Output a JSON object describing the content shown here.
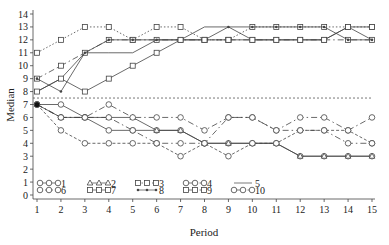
{
  "chart_data": {
    "type": "line",
    "title": "",
    "xlabel": "Period",
    "ylabel": "Median",
    "xlim": [
      1,
      15
    ],
    "ylim": [
      0,
      14
    ],
    "x": [
      1,
      2,
      3,
      4,
      5,
      6,
      7,
      8,
      9,
      10,
      11,
      12,
      13,
      14,
      15
    ],
    "x_ticks": [
      "1",
      "2",
      "3",
      "4",
      "5",
      "6",
      "7",
      "8",
      "9",
      "10",
      "11",
      "12",
      "13",
      "14",
      "15"
    ],
    "y_ticks": [
      "0",
      "1",
      "2",
      "3",
      "4",
      "5",
      "6",
      "7",
      "8",
      "9",
      "10",
      "11",
      "12",
      "13",
      "14"
    ],
    "grid": false,
    "reference_line": {
      "y": 7.5,
      "style": "dashed"
    },
    "legend": {
      "position": "bottom-inside",
      "entries": [
        {
          "label": "1",
          "marker": "circle",
          "line": "solid"
        },
        {
          "label": "2",
          "marker": "triangle",
          "line": "solid"
        },
        {
          "label": "3",
          "marker": "square",
          "line": "dotted"
        },
        {
          "label": "4",
          "marker": "circle",
          "line": "dash-dot"
        },
        {
          "label": "5",
          "marker": "none",
          "line": "solid"
        },
        {
          "label": "6",
          "marker": "circle",
          "line": "dashed"
        },
        {
          "label": "7",
          "marker": "square",
          "line": "solid"
        },
        {
          "label": "8",
          "marker": "dot",
          "line": "solid"
        },
        {
          "label": "9",
          "marker": "square",
          "line": "dash-dot"
        },
        {
          "label": "10",
          "marker": "circle",
          "line": "dash-dot"
        }
      ]
    },
    "series": [
      {
        "name": "3",
        "values": [
          11,
          12,
          13,
          13,
          12,
          13,
          13,
          12,
          12,
          13,
          13,
          13,
          13,
          13,
          13
        ]
      },
      {
        "name": "9",
        "values": [
          9,
          10,
          11,
          12,
          12,
          12,
          12,
          12,
          12,
          12,
          12,
          12,
          12,
          12,
          12
        ]
      },
      {
        "name": "5",
        "values": [
          8,
          9,
          11,
          11,
          11,
          12,
          12,
          13,
          13,
          12,
          12,
          12,
          12,
          13,
          12
        ]
      },
      {
        "name": "8",
        "values": [
          9,
          8,
          11,
          12,
          12,
          12,
          12,
          12,
          13,
          13,
          13,
          13,
          13,
          12,
          12
        ]
      },
      {
        "name": "7",
        "values": [
          8,
          9,
          8,
          9,
          10,
          11,
          12,
          12,
          12,
          12,
          12,
          12,
          12,
          13,
          13
        ]
      },
      {
        "name": "1",
        "values": [
          7,
          7,
          6,
          5,
          5,
          5,
          5,
          4,
          4,
          4,
          4,
          3,
          3,
          3,
          3
        ]
      },
      {
        "name": "2",
        "values": [
          7,
          6,
          6,
          6,
          6,
          5,
          5,
          4,
          4,
          4,
          4,
          3,
          3,
          3,
          3
        ]
      },
      {
        "name": "4",
        "values": [
          7,
          6,
          6,
          6,
          5,
          4,
          4,
          4,
          6,
          6,
          5,
          5,
          5,
          4,
          4
        ]
      },
      {
        "name": "6",
        "values": [
          7,
          5,
          4,
          4,
          4,
          4,
          3,
          4,
          3,
          4,
          4,
          5,
          5,
          5,
          4
        ]
      },
      {
        "name": "10",
        "values": [
          7,
          6,
          6,
          7,
          6,
          6,
          6,
          5,
          6,
          6,
          5,
          6,
          6,
          5,
          6
        ]
      }
    ]
  },
  "legend_labels": {
    "l1": "1",
    "l2": "2",
    "l3": "3",
    "l4": "4",
    "l5": "5",
    "l6": "6",
    "l7": "7",
    "l8": "8",
    "l9": "9",
    "l10": "10"
  }
}
